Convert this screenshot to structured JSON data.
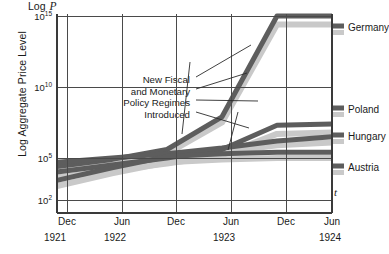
{
  "axes": {
    "y_title": "Log Aggregate Price Level",
    "y_header_prefix": "Log",
    "y_header_var": "P",
    "x_var": "t",
    "y_ticks": [
      {
        "mantissa": "10",
        "exp": "15"
      },
      {
        "mantissa": "10",
        "exp": "10"
      },
      {
        "mantissa": "10",
        "exp": "5"
      },
      {
        "mantissa": "10",
        "exp": "2"
      }
    ],
    "x_ticks": [
      "Dec",
      "Jun",
      "Dec",
      "Jun",
      "Dec",
      "Jun"
    ],
    "x_years": [
      "1921",
      "1922",
      "",
      "1923",
      "",
      "1924"
    ]
  },
  "annotation": {
    "line1": "New Fiscal",
    "line2": "and Monetary",
    "line3": "Policy Regimes",
    "line4": "Introduced"
  },
  "legend": {
    "germany": "Germany",
    "poland": "Poland",
    "hungary": "Hungary",
    "austria": "Austria"
  },
  "colors": {
    "line_dark": "#5d5d5d",
    "line_shadow": "#c9c9c9",
    "frame": "#3a3a3a",
    "grid": "#4a4a4a"
  },
  "chart_data": {
    "type": "line",
    "title": "",
    "xlabel": "t",
    "ylabel": "Log Aggregate Price Level",
    "ylim": [
      2,
      15.5
    ],
    "y_scale": "log10 exponent",
    "grid": true,
    "legend_position": "right-inline",
    "x": [
      "Dec 1921",
      "Jun 1922",
      "Dec 1922",
      "Jun 1923",
      "Dec 1923",
      "Jun 1924"
    ],
    "series": [
      {
        "name": "Germany",
        "style": "dark",
        "values": [
          4.4,
          4.9,
          5.6,
          7.9,
          15.0,
          15.0
        ]
      },
      {
        "name": "Germany",
        "style": "shadow",
        "values": [
          4.1,
          4.6,
          5.3,
          7.5,
          14.4,
          14.4
        ]
      },
      {
        "name": "Poland",
        "style": "dark",
        "values": [
          4.0,
          4.5,
          5.0,
          5.6,
          7.3,
          7.4
        ]
      },
      {
        "name": "Poland",
        "style": "shadow",
        "values": [
          3.6,
          4.1,
          4.6,
          5.2,
          6.7,
          6.8
        ]
      },
      {
        "name": "Hungary",
        "style": "dark",
        "values": [
          4.7,
          5.0,
          5.3,
          5.7,
          6.2,
          6.5
        ]
      },
      {
        "name": "Hungary",
        "style": "shadow",
        "values": [
          4.3,
          4.6,
          5.0,
          5.4,
          5.9,
          6.1
        ]
      },
      {
        "name": "Austria",
        "style": "dark",
        "values": [
          3.4,
          4.3,
          5.1,
          5.3,
          5.4,
          5.4
        ]
      },
      {
        "name": "Austria",
        "style": "shadow",
        "values": [
          3.0,
          3.9,
          4.7,
          4.9,
          5.0,
          5.0
        ]
      }
    ],
    "annotations": [
      {
        "text": "New Fiscal and Monetary Policy Regimes Introduced",
        "points_to": [
          "Germany Dec 1923 onset",
          "Poland",
          "Hungary",
          "Austria"
        ]
      }
    ]
  }
}
